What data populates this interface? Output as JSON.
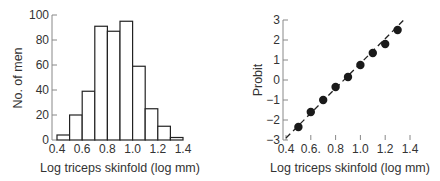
{
  "chart_data": [
    {
      "type": "bar",
      "subtype": "histogram",
      "title": "",
      "xlabel": "Log triceps skinfold (log mm)",
      "ylabel": "No. of men",
      "bin_edges": [
        0.4,
        0.5,
        0.6,
        0.7,
        0.8,
        0.9,
        1.0,
        1.1,
        1.2,
        1.3,
        1.4
      ],
      "categories": [
        "0.4-0.5",
        "0.5-0.6",
        "0.6-0.7",
        "0.7-0.8",
        "0.8-0.9",
        "0.9-1.0",
        "1.0-1.1",
        "1.1-1.2",
        "1.2-1.3",
        "1.3-1.4"
      ],
      "values": [
        4,
        20,
        39,
        91,
        87,
        95,
        59,
        25,
        11,
        2
      ],
      "xlim": [
        0.4,
        1.4
      ],
      "ylim": [
        0,
        100
      ],
      "xticks": [
        "0.4",
        "0.6",
        "0.8",
        "1.0",
        "1.2",
        "1.4"
      ],
      "yticks": [
        "0",
        "20",
        "40",
        "60",
        "80",
        "100"
      ],
      "grid": false,
      "legend": null
    },
    {
      "type": "scatter",
      "title": "",
      "xlabel": "Log triceps skinfold (log mm)",
      "ylabel": "Probit",
      "x": [
        0.5,
        0.6,
        0.7,
        0.8,
        0.9,
        1.0,
        1.1,
        1.2,
        1.3
      ],
      "y": [
        -2.35,
        -1.6,
        -1.0,
        -0.35,
        0.15,
        0.75,
        1.35,
        1.8,
        2.5
      ],
      "fit_line": {
        "style": "dashed",
        "from": [
          0.4,
          -2.9
        ],
        "to": [
          1.35,
          3.0
        ]
      },
      "xlim": [
        0.4,
        1.4
      ],
      "ylim": [
        -3,
        3
      ],
      "xticks": [
        "0.4",
        "0.6.",
        "0.8",
        "1.0",
        "1.2",
        "1.4"
      ],
      "yticks": [
        "-3",
        "-2",
        "-1",
        "0",
        "1",
        "2",
        "3"
      ],
      "grid": false,
      "legend": null
    }
  ],
  "left": {
    "ylabel": "No. of men",
    "xlabel": "Log triceps skinfold (log mm)",
    "yticks": [
      "0",
      "20",
      "40",
      "60",
      "80",
      "100"
    ],
    "xticks": [
      "0.4",
      "0.6",
      "0.8",
      "1.0",
      "1.2",
      "1.4"
    ]
  },
  "right": {
    "ylabel": "Probit",
    "xlabel": "Log triceps skinfold (log mm)",
    "yticks": [
      "−3",
      "−2",
      "−1",
      "0",
      "1",
      "2",
      "3"
    ],
    "xticks": [
      "0.4",
      "0.6.",
      "0.8",
      "1.0",
      "1.2",
      "1.4"
    ]
  }
}
